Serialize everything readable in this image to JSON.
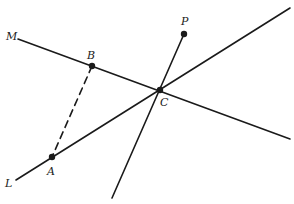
{
  "diagram": {
    "stroke_color": "#1a1a1a",
    "points": {
      "M": {
        "label": "M",
        "x": 18,
        "y": 39,
        "label_x": 6,
        "label_y": 40
      },
      "B": {
        "label": "B",
        "x": 92,
        "y": 66,
        "label_x": 87,
        "label_y": 59
      },
      "C": {
        "label": "C",
        "x": 160,
        "y": 90,
        "label_x": 160,
        "label_y": 106
      },
      "P": {
        "label": "P",
        "x": 184,
        "y": 34,
        "label_x": 181,
        "label_y": 25
      },
      "A": {
        "label": "A",
        "x": 52,
        "y": 157,
        "label_x": 47,
        "label_y": 175
      },
      "L": {
        "label": "L",
        "x": 16,
        "y": 180,
        "label_x": 5,
        "label_y": 187
      }
    },
    "lines": [
      {
        "name": "line-M",
        "x1": 18,
        "y1": 39,
        "x2": 290,
        "y2": 139,
        "style": "solid"
      },
      {
        "name": "line-L",
        "x1": 16,
        "y1": 180,
        "x2": 290,
        "y2": 8,
        "style": "solid"
      },
      {
        "name": "line-PC",
        "x1": 184,
        "y1": 34,
        "x2": 112,
        "y2": 198,
        "style": "solid"
      },
      {
        "name": "segment-BA",
        "x1": 92,
        "y1": 66,
        "x2": 52,
        "y2": 157,
        "style": "dashed"
      }
    ],
    "dots": [
      "B",
      "C",
      "P",
      "A"
    ]
  }
}
